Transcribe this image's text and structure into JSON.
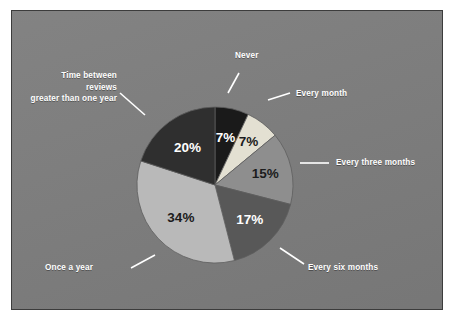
{
  "figure": {
    "background_color": "#7d7d7d",
    "frame_border_color": "#3c3c3c",
    "page_color": "#ffffff",
    "label_text_color": "#ffffff",
    "leader_line_color": "#ffffff"
  },
  "chart_data": {
    "type": "pie",
    "title": "",
    "subtitle": "",
    "xlabel": "",
    "ylabel": "",
    "legend_position": "external-callouts",
    "grid": false,
    "start_angle_deg": 0,
    "direction": "clockwise",
    "total": 100,
    "units": "%",
    "categories": [
      "Never",
      "Every month",
      "Every three months",
      "Every six months",
      "Once a year",
      "Time between reviews greater than one year"
    ],
    "values": [
      7,
      7,
      15,
      17,
      34,
      20
    ],
    "value_labels": [
      "7%",
      "7%",
      "15%",
      "17%",
      "34%",
      "20%"
    ],
    "colors": [
      "#1a1a1a",
      "#e3e0d2",
      "#8e8e8e",
      "#585858",
      "#b9b9b9",
      "#2f2f2f"
    ],
    "slices": [
      {
        "label": "Never",
        "label_line_1": "Never",
        "label_line_2": "",
        "value": 7,
        "value_label": "7%",
        "color": "#1a1a1a",
        "value_text_color": "#ffffff"
      },
      {
        "label": "Every month",
        "label_line_1": "Every month",
        "label_line_2": "",
        "value": 7,
        "value_label": "7%",
        "color": "#e3e0d2",
        "value_text_color": "#1c1c1c"
      },
      {
        "label": "Every three months",
        "label_line_1": "Every three months",
        "label_line_2": "",
        "value": 15,
        "value_label": "15%",
        "color": "#8e8e8e",
        "value_text_color": "#1c1c1c"
      },
      {
        "label": "Every six months",
        "label_line_1": "Every six months",
        "label_line_2": "",
        "value": 17,
        "value_label": "17%",
        "color": "#585858",
        "value_text_color": "#ffffff"
      },
      {
        "label": "Once a year",
        "label_line_1": "Once a year",
        "label_line_2": "",
        "value": 34,
        "value_label": "34%",
        "color": "#b9b9b9",
        "value_text_color": "#1c1c1c"
      },
      {
        "label": "Time between reviews greater than one year",
        "label_line_1": "Time between reviews",
        "label_line_2": "greater than one year",
        "value": 20,
        "value_label": "20%",
        "color": "#2f2f2f",
        "value_text_color": "#ffffff"
      }
    ]
  }
}
